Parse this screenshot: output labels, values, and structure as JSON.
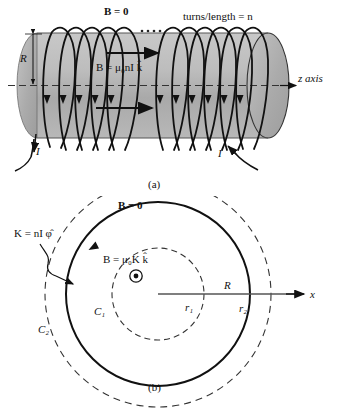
{
  "figure": {
    "colors": {
      "cylinder_fill": "#b4b4b4",
      "cylinder_end_fill": "#a8a8a8",
      "stroke": "#111111",
      "axis_dash": "#333333",
      "background": "#ffffff"
    }
  },
  "panel_a": {
    "caption": "(a)",
    "b_outside_label": "B = 0",
    "turns_label": "turns/length = n",
    "radius_label": "R",
    "b_inside_label": "B = μ₀nI k̂",
    "axis_label": "z axis",
    "current_left_label": "I",
    "current_right_label": "I",
    "coil_count_left": 5,
    "coil_count_right": 6,
    "ellipsis_label": "· · · ·"
  },
  "panel_b": {
    "caption": "(b)",
    "b_outside_label": "B = 0",
    "surface_current_label": "K = nI φ̂",
    "b_inside_label": "B = μ₀K k̂",
    "radius_label": "R",
    "axis_label": "x",
    "inner_radius_label": "r₁",
    "outer_radius_label": "r₂",
    "contour_inner_label": "C₁",
    "contour_outer_label": "C₂",
    "field_out_of_page_symbol": "⊙",
    "circle_radii_px": {
      "c1": 46,
      "solenoid_R": 92,
      "c2": 113
    }
  }
}
